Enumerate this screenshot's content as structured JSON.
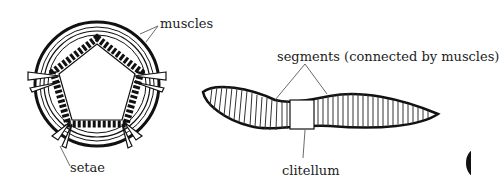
{
  "diagram": {
    "cross_section": {
      "labels": {
        "muscles": "muscles",
        "setae": "setae"
      }
    },
    "side_view": {
      "labels": {
        "segments": "segments (connected by muscles)",
        "clitellum": "clitellum"
      }
    }
  }
}
